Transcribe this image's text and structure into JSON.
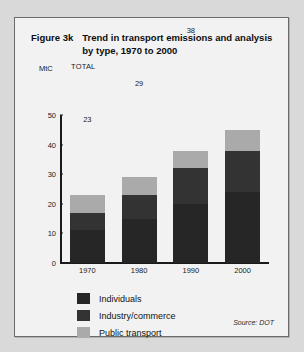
{
  "figure": {
    "label": "Figure 3k",
    "title": "Trend in transport emissions and analysis by type, 1970 to 2000",
    "source": "Source: DOT"
  },
  "axis": {
    "unit": "MtC",
    "total_header": "TOTAL"
  },
  "colors": {
    "individuals": "#262626",
    "industry": "#333333",
    "public_transport": "#aaaaaa",
    "panel_background": "#f2f2f2",
    "page_background": "#d9d9d9",
    "axis": "#1a1a1a"
  },
  "chart_data": {
    "type": "bar",
    "title": "Trend in transport emissions and analysis by type, 1970 to 2000",
    "xlabel": "",
    "ylabel": "MtC",
    "ylim": [
      0,
      50
    ],
    "yticks": [
      0,
      10,
      20,
      30,
      40,
      50
    ],
    "grid": false,
    "stacked": true,
    "legend_position": "bottom-left",
    "categories": [
      "1970",
      "1980",
      "1990",
      "2000"
    ],
    "totals": [
      23,
      29,
      38,
      45
    ],
    "series": [
      {
        "name": "Individuals",
        "values": [
          11,
          15,
          20,
          24
        ]
      },
      {
        "name": "Industry/commerce",
        "values": [
          6,
          8,
          12,
          14
        ]
      },
      {
        "name": "Public transport",
        "values": [
          6,
          6,
          6,
          7
        ]
      }
    ]
  }
}
